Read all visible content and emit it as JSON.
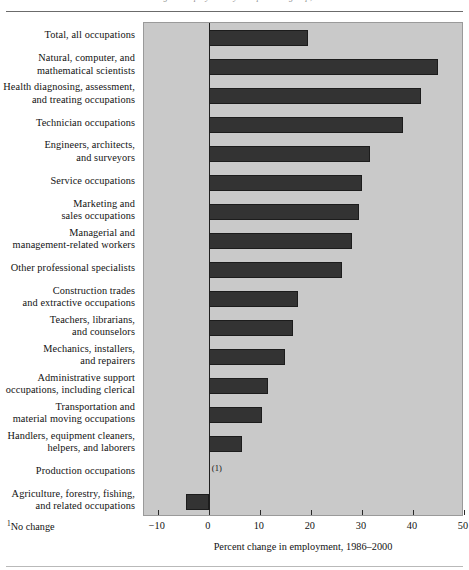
{
  "figure": {
    "clipped_caption": "Percent change in employment by occupational group, 1986–2000",
    "footnote_marker": "1",
    "footnote_text": "No change",
    "no_change_label": "(1)"
  },
  "chart_data": {
    "type": "bar",
    "orientation": "horizontal",
    "title": "",
    "xlabel": "Percent change in employment, 1986–2000",
    "ylabel": "",
    "xlim": [
      -12.7,
      50
    ],
    "xticks": [
      -10,
      0,
      10,
      20,
      30,
      40,
      50
    ],
    "xtick_labels": [
      "−10",
      "0",
      "10",
      "20",
      "30",
      "40",
      "50"
    ],
    "grid": false,
    "legend": "none",
    "bar_color": "#333333",
    "plot_background": "#c9c9c9",
    "categories": [
      "Total, all occupations",
      "Natural, computer, and mathematical scientists",
      "Health diagnosing, assessment, and treating occupations",
      "Technician occupations",
      "Engineers, architects, and surveyors",
      "Service occupations",
      "Marketing and sales occupations",
      "Managerial and management-related workers",
      "Other professional specialists",
      "Construction trades and extractive occupations",
      "Teachers, librarians, and counselors",
      "Mechanics, installers, and repairers",
      "Administrative support occupations, including clerical",
      "Transportation and material moving occupations",
      "Handlers, equipment cleaners, helpers, and laborers",
      "Production occupations",
      "Agriculture, forestry, fishing, and related occupations"
    ],
    "category_lines": [
      [
        "Total, all occupations"
      ],
      [
        "Natural, computer, and",
        "mathematical scientists"
      ],
      [
        "Health diagnosing, assessment,",
        "and treating occupations"
      ],
      [
        "Technician occupations"
      ],
      [
        "Engineers, architects,",
        "and surveyors"
      ],
      [
        "Service occupations"
      ],
      [
        "Marketing and",
        "sales occupations"
      ],
      [
        "Managerial and",
        "management-related workers"
      ],
      [
        "Other professional specialists"
      ],
      [
        "Construction trades",
        "and extractive occupations"
      ],
      [
        "Teachers, librarians,",
        "and counselors"
      ],
      [
        "Mechanics, installers,",
        "and repairers"
      ],
      [
        "Administrative support",
        "occupations, including clerical"
      ],
      [
        "Transportation and",
        "material moving occupations"
      ],
      [
        "Handlers, equipment cleaners,",
        "helpers, and laborers"
      ],
      [
        "Production occupations"
      ],
      [
        "Agriculture, forestry, fishing,",
        "and related occupations"
      ]
    ],
    "values": [
      19.5,
      45.0,
      41.5,
      38.0,
      31.5,
      30.0,
      29.5,
      28.0,
      26.0,
      17.5,
      16.5,
      15.0,
      11.5,
      10.5,
      6.5,
      0,
      -4.5
    ],
    "value_notes": {
      "15": "no change (0 percent); annotated (1)"
    }
  }
}
